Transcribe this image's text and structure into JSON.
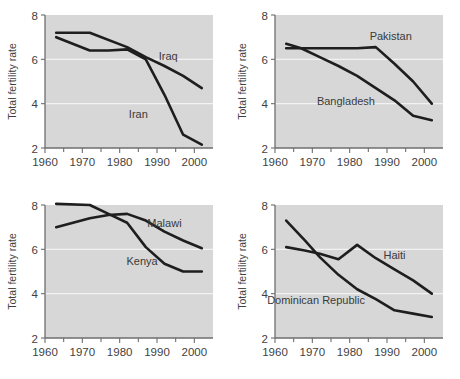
{
  "figure": {
    "title": "",
    "panel_count": 4
  },
  "chart_data": [
    {
      "id": "iraq-iran",
      "type": "line",
      "title": "",
      "xlabel": "",
      "ylabel": "Total fertility rate",
      "xlim": [
        1960,
        2005
      ],
      "ylim": [
        2,
        8
      ],
      "xticks": [
        1960,
        1970,
        1980,
        1990,
        2000
      ],
      "xticklabels": [
        "1960",
        "1970",
        "1980",
        "1990",
        "2000"
      ],
      "xminorticks": [
        1965,
        1975,
        1985,
        1995
      ],
      "yticks": [
        2,
        4,
        6,
        8
      ],
      "yticklabels": [
        "2",
        "4",
        "6",
        "8"
      ],
      "gridlines_y": [
        4,
        6
      ],
      "grid": true,
      "legend_position": "inline-annotation",
      "series": [
        {
          "name": "Iraq",
          "label_x": 1993,
          "label_y": 5.95,
          "x": [
            1963,
            1972,
            1982,
            1987,
            1992,
            1997,
            2002
          ],
          "values": [
            7.2,
            7.2,
            6.55,
            6.1,
            5.7,
            5.25,
            4.7
          ]
        },
        {
          "name": "Iran",
          "label_x": 1985,
          "label_y": 3.35,
          "x": [
            1963,
            1972,
            1977,
            1982,
            1987,
            1992,
            1997,
            2002
          ],
          "values": [
            7.0,
            6.4,
            6.4,
            6.45,
            6.0,
            4.4,
            2.6,
            2.15
          ]
        }
      ]
    },
    {
      "id": "pakistan-bangladesh",
      "type": "line",
      "title": "",
      "xlabel": "",
      "ylabel": "Total fertility rate",
      "xlim": [
        1960,
        2005
      ],
      "ylim": [
        2,
        8
      ],
      "xticks": [
        1960,
        1970,
        1980,
        1990,
        2000
      ],
      "xticklabels": [
        "1960",
        "1970",
        "1980",
        "1990",
        "2000"
      ],
      "xminorticks": [
        1965,
        1975,
        1985,
        1995
      ],
      "yticks": [
        2,
        4,
        6,
        8
      ],
      "yticklabels": [
        "2",
        "4",
        "6",
        "8"
      ],
      "gridlines_y": [
        4,
        6
      ],
      "grid": true,
      "legend_position": "inline-annotation",
      "series": [
        {
          "name": "Pakistan",
          "label_x": 1991,
          "label_y": 6.85,
          "x": [
            1963,
            1972,
            1982,
            1987,
            1992,
            1997,
            2002
          ],
          "values": [
            6.5,
            6.5,
            6.5,
            6.55,
            5.8,
            5.0,
            4.0
          ]
        },
        {
          "name": "Bangladesh",
          "label_x": 1979,
          "label_y": 3.95,
          "x": [
            1963,
            1967,
            1972,
            1977,
            1982,
            1987,
            1992,
            1997,
            2002
          ],
          "values": [
            6.7,
            6.5,
            6.1,
            5.7,
            5.25,
            4.7,
            4.15,
            3.45,
            3.25
          ]
        }
      ]
    },
    {
      "id": "malawi-kenya",
      "type": "line",
      "title": "",
      "xlabel": "",
      "ylabel": "Total fertility rate",
      "xlim": [
        1960,
        2005
      ],
      "ylim": [
        2,
        8
      ],
      "xticks": [
        1960,
        1970,
        1980,
        1990,
        2000
      ],
      "xticklabels": [
        "1960",
        "1970",
        "1980",
        "1990",
        "2000"
      ],
      "xminorticks": [
        1965,
        1975,
        1985,
        1995
      ],
      "yticks": [
        2,
        4,
        6,
        8
      ],
      "yticklabels": [
        "2",
        "4",
        "6",
        "8"
      ],
      "gridlines_y": [
        4,
        6
      ],
      "grid": true,
      "legend_position": "inline-annotation",
      "series": [
        {
          "name": "Malawi",
          "label_x": 1992,
          "label_y": 7.0,
          "x": [
            1963,
            1972,
            1977,
            1982,
            1987,
            1992,
            1997,
            2002
          ],
          "values": [
            7.0,
            7.4,
            7.55,
            7.6,
            7.3,
            6.8,
            6.4,
            6.05
          ]
        },
        {
          "name": "Kenya",
          "label_x": 1986,
          "label_y": 5.3,
          "x": [
            1963,
            1972,
            1977,
            1982,
            1987,
            1992,
            1997,
            2002
          ],
          "values": [
            8.05,
            8.0,
            7.6,
            7.2,
            6.1,
            5.35,
            5.0,
            5.0
          ]
        }
      ]
    },
    {
      "id": "haiti-dominican-republic",
      "type": "line",
      "title": "",
      "xlabel": "",
      "ylabel": "Total fertility rate",
      "xlim": [
        1960,
        2005
      ],
      "ylim": [
        2,
        8
      ],
      "xticks": [
        1960,
        1970,
        1980,
        1990,
        2000
      ],
      "xticklabels": [
        "1960",
        "1970",
        "1980",
        "1990",
        "2000"
      ],
      "xminorticks": [
        1965,
        1975,
        1985,
        1995
      ],
      "yticks": [
        2,
        4,
        6,
        8
      ],
      "yticklabels": [
        "2",
        "4",
        "6",
        "8"
      ],
      "gridlines_y": [
        4,
        6
      ],
      "grid": true,
      "legend_position": "inline-annotation",
      "series": [
        {
          "name": "Haiti",
          "label_x": 1992,
          "label_y": 5.55,
          "x": [
            1963,
            1968,
            1972,
            1977,
            1982,
            1987,
            1992,
            1997,
            2002
          ],
          "values": [
            6.1,
            5.95,
            5.8,
            5.55,
            6.2,
            5.6,
            5.1,
            4.6,
            4.0
          ]
        },
        {
          "name": "Dominican Republic",
          "label_x": 1971,
          "label_y": 3.55,
          "x": [
            1963,
            1968,
            1972,
            1977,
            1982,
            1987,
            1992,
            1997,
            2002
          ],
          "values": [
            7.3,
            6.4,
            5.65,
            4.85,
            4.2,
            3.75,
            3.25,
            3.1,
            2.95
          ]
        }
      ]
    }
  ],
  "colors": {
    "plot_background": "#d7d7d7",
    "gridline": "#f2f2f2",
    "axis": "#6e6e6e",
    "line": "#1e1e1e",
    "text": "#3f3f3f",
    "page_background": "#ffffff"
  }
}
